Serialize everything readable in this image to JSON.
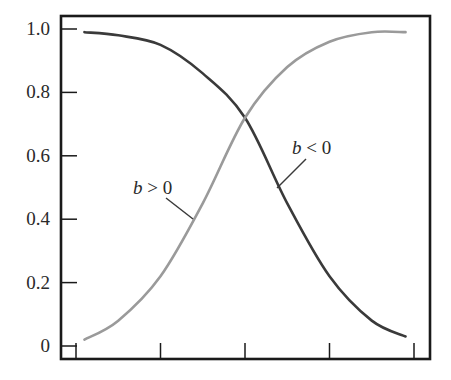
{
  "chart_data": {
    "type": "line",
    "title": "",
    "xlabel": "",
    "ylabel": "",
    "ylim": [
      0,
      1.0
    ],
    "grid": false,
    "legend": "none (inline annotations)",
    "y_ticks": [
      {
        "value": 0,
        "label": "0"
      },
      {
        "value": 0.2,
        "label": "0.2"
      },
      {
        "value": 0.4,
        "label": "0.4"
      },
      {
        "value": 0.6,
        "label": "0.6"
      },
      {
        "value": 0.8,
        "label": "0.8"
      },
      {
        "value": 1.0,
        "label": "1.0"
      }
    ],
    "x_ticks": [
      0,
      1,
      2,
      3,
      4
    ],
    "x_tick_labels": [
      "",
      "",
      "",
      "",
      ""
    ],
    "x": [
      0.1,
      0.5,
      1.0,
      1.5,
      2.0,
      2.5,
      3.0,
      3.5,
      3.9
    ],
    "series": [
      {
        "name": "b < 0",
        "color": "#3a3a3a",
        "description": "decreasing sigmoid",
        "values": [
          0.99,
          0.98,
          0.95,
          0.86,
          0.72,
          0.45,
          0.22,
          0.08,
          0.03
        ]
      },
      {
        "name": "b > 0",
        "color": "#9a9a9a",
        "description": "increasing sigmoid",
        "values": [
          0.02,
          0.08,
          0.22,
          0.45,
          0.72,
          0.88,
          0.96,
          0.99,
          0.99
        ]
      }
    ],
    "annotations": [
      {
        "text_var": "b",
        "text_op": " > 0",
        "series": "b > 0"
      },
      {
        "text_var": "b",
        "text_op": " < 0",
        "series": "b < 0"
      }
    ]
  },
  "colors": {
    "frame": "#1a1a1a",
    "dark_curve": "#3a3a3a",
    "light_curve": "#9a9a9a"
  }
}
